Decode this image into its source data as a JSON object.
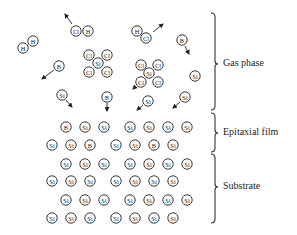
{
  "diagram": {
    "type": "epitaxial-growth-schematic",
    "regions": [
      {
        "id": "gas",
        "label": "Gas phase",
        "y_top": 13,
        "y_bottom": 110,
        "tip_y": 64
      },
      {
        "id": "film",
        "label": "Epitaxial film",
        "y_top": 113,
        "y_bottom": 152,
        "tip_y": 133
      },
      {
        "id": "substrate",
        "label": "Substrate",
        "y_top": 154,
        "y_bottom": 223,
        "tip_y": 187
      }
    ],
    "gas_phase_species": [
      {
        "name": "H2",
        "atoms": [
          {
            "el": "H",
            "x": 23,
            "y": 48
          },
          {
            "el": "H",
            "x": 33,
            "y": 41
          }
        ],
        "arrow": null
      },
      {
        "name": "HCl",
        "atoms": [
          {
            "el": "Cl",
            "x": 76,
            "y": 31
          },
          {
            "el": "H",
            "x": 88,
            "y": 31
          }
        ],
        "arrow": {
          "x1": 72,
          "y1": 24,
          "x2": 65,
          "y2": 14
        }
      },
      {
        "name": "HCl",
        "atoms": [
          {
            "el": "H",
            "x": 137,
            "y": 31
          },
          {
            "el": "Cl",
            "x": 146,
            "y": 38
          }
        ],
        "arrow": {
          "x1": 153,
          "y1": 32,
          "x2": 163,
          "y2": 24
        }
      },
      {
        "name": "B",
        "atoms": [
          {
            "el": "B",
            "x": 182,
            "y": 40
          }
        ],
        "arrow": {
          "x1": 185,
          "y1": 46,
          "x2": 189,
          "y2": 54
        }
      },
      {
        "name": "SiCl4",
        "atoms": [
          {
            "el": "Cl",
            "x": 89,
            "y": 55
          },
          {
            "el": "Cl",
            "x": 107,
            "y": 55
          },
          {
            "el": "Si",
            "x": 98,
            "y": 63
          },
          {
            "el": "Cl",
            "x": 89,
            "y": 72
          },
          {
            "el": "Cl",
            "x": 107,
            "y": 72
          }
        ],
        "arrow": null
      },
      {
        "name": "SiCl4",
        "atoms": [
          {
            "el": "Cl",
            "x": 141,
            "y": 65
          },
          {
            "el": "Cl",
            "x": 158,
            "y": 65
          },
          {
            "el": "Si",
            "x": 149,
            "y": 73
          },
          {
            "el": "Cl",
            "x": 141,
            "y": 82
          },
          {
            "el": "Cl",
            "x": 158,
            "y": 82
          }
        ],
        "arrow": {
          "x1": 136,
          "y1": 86,
          "x2": 133,
          "y2": 89
        }
      },
      {
        "name": "B",
        "atoms": [
          {
            "el": "B",
            "x": 59,
            "y": 66
          }
        ],
        "arrow": {
          "x1": 54,
          "y1": 70,
          "x2": 42,
          "y2": 79
        }
      },
      {
        "name": "Si",
        "atoms": [
          {
            "el": "Si",
            "x": 195,
            "y": 76
          }
        ],
        "arrow": null
      },
      {
        "name": "Si",
        "atoms": [
          {
            "el": "Si",
            "x": 62,
            "y": 95
          }
        ],
        "arrow": {
          "x1": 66,
          "y1": 100,
          "x2": 72,
          "y2": 107
        }
      },
      {
        "name": "B",
        "atoms": [
          {
            "el": "B",
            "x": 107,
            "y": 97
          }
        ],
        "arrow": {
          "x1": 107,
          "y1": 103,
          "x2": 107,
          "y2": 111
        }
      },
      {
        "name": "Si",
        "atoms": [
          {
            "el": "Si",
            "x": 148,
            "y": 101
          }
        ],
        "arrow": {
          "x1": 143,
          "y1": 105,
          "x2": 137,
          "y2": 110
        }
      },
      {
        "name": "Si",
        "atoms": [
          {
            "el": "Si",
            "x": 185,
            "y": 97
          }
        ],
        "arrow": {
          "x1": 180,
          "y1": 102,
          "x2": 173,
          "y2": 108
        }
      }
    ],
    "lattice": {
      "rows": [
        {
          "y": 127,
          "xs": [
            66,
            85,
            104,
            130,
            149,
            168,
            187
          ],
          "els": [
            "B",
            "Si",
            "Si",
            "Si",
            "Si",
            "Si",
            "Si"
          ],
          "region": "film"
        },
        {
          "y": 145,
          "xs": [
            52,
            71,
            90,
            116,
            135,
            154,
            173
          ],
          "els": [
            "Si",
            "Si",
            "B",
            "Si",
            "Si",
            "B",
            "Si"
          ],
          "region": "film"
        },
        {
          "y": 164,
          "xs": [
            66,
            85,
            104,
            130,
            149,
            168,
            187
          ],
          "els": [
            "Si",
            "Si",
            "Si",
            "Si",
            "Si",
            "Si",
            "Si"
          ],
          "region": "substrate"
        },
        {
          "y": 181,
          "xs": [
            52,
            71,
            90,
            116,
            135,
            154,
            173
          ],
          "els": [
            "Si",
            "Si",
            "Si",
            "Si",
            "Si",
            "Si",
            "Si"
          ],
          "region": "substrate"
        },
        {
          "y": 200,
          "xs": [
            66,
            85,
            104,
            130,
            149,
            168,
            187
          ],
          "els": [
            "Si",
            "Si",
            "Si",
            "Si",
            "Si",
            "Si",
            "Si"
          ],
          "region": "substrate"
        },
        {
          "y": 218,
          "xs": [
            52,
            71,
            90,
            116,
            135,
            154,
            173
          ],
          "els": [
            "Si",
            "Si",
            "Si",
            "Si",
            "Si",
            "Si",
            "Si"
          ],
          "region": "substrate"
        }
      ]
    },
    "style": {
      "ink": "#222222",
      "background": "#ffffff",
      "atom_radius": 5.2,
      "brace_x": 211
    }
  }
}
